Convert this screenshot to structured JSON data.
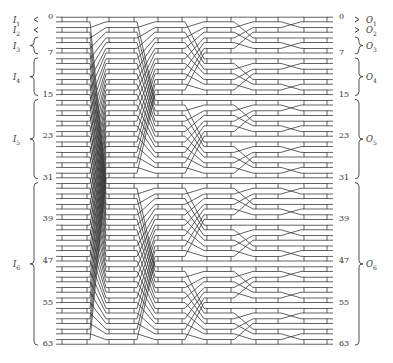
{
  "diagram": {
    "type": "multistage shuffle switching network",
    "lines": 64,
    "rows_per_column": 32,
    "stages": 6,
    "colors": {
      "stroke": "#3a3a3a",
      "box_fill": "#ffffff",
      "background": "#ffffff"
    },
    "layout": {
      "row0_y": 19.5,
      "row_spacing": 10.4,
      "box_height": 4.6,
      "columns_x": [
        [
          62,
          87
        ],
        [
          109,
          134
        ],
        [
          158,
          182
        ],
        [
          207,
          231
        ],
        [
          256,
          278
        ],
        [
          304,
          327
        ]
      ],
      "input_stub_x": 56,
      "output_stub_x": 333
    },
    "input_index_labels": [
      {
        "text": "0",
        "row": 0
      },
      {
        "text": "7",
        "row": 3
      },
      {
        "text": "15",
        "row": 7
      },
      {
        "text": "23",
        "row": 11
      },
      {
        "text": "31",
        "row": 15
      },
      {
        "text": "39",
        "row": 19
      },
      {
        "text": "47",
        "row": 23
      },
      {
        "text": "55",
        "row": 27
      },
      {
        "text": "63",
        "row": 31
      }
    ],
    "output_index_labels": [
      {
        "text": "0",
        "row": 0
      },
      {
        "text": "7",
        "row": 3
      },
      {
        "text": "15",
        "row": 7
      },
      {
        "text": "23",
        "row": 11
      },
      {
        "text": "31",
        "row": 15
      },
      {
        "text": "39",
        "row": 19
      },
      {
        "text": "47",
        "row": 23
      },
      {
        "text": "55",
        "row": 27
      },
      {
        "text": "63",
        "row": 31
      }
    ],
    "input_groups": [
      {
        "name": "I",
        "sub": "1",
        "from_row": 0,
        "to_row": 0,
        "marker": "arrow"
      },
      {
        "name": "I",
        "sub": "2",
        "from_row": 1,
        "to_row": 1,
        "marker": "arrow"
      },
      {
        "name": "I",
        "sub": "3",
        "from_row": 2,
        "to_row": 3,
        "marker": "brace"
      },
      {
        "name": "I",
        "sub": "4",
        "from_row": 4,
        "to_row": 7,
        "marker": "brace"
      },
      {
        "name": "I",
        "sub": "5",
        "from_row": 8,
        "to_row": 15,
        "marker": "brace"
      },
      {
        "name": "I",
        "sub": "6",
        "from_row": 16,
        "to_row": 31,
        "marker": "brace"
      }
    ],
    "output_groups": [
      {
        "name": "O",
        "sub": "1",
        "from_row": 0,
        "to_row": 0,
        "marker": "arrow"
      },
      {
        "name": "O",
        "sub": "2",
        "from_row": 1,
        "to_row": 1,
        "marker": "arrow"
      },
      {
        "name": "O",
        "sub": "3",
        "from_row": 2,
        "to_row": 3,
        "marker": "brace"
      },
      {
        "name": "O",
        "sub": "4",
        "from_row": 4,
        "to_row": 7,
        "marker": "brace"
      },
      {
        "name": "O",
        "sub": "5",
        "from_row": 8,
        "to_row": 15,
        "marker": "brace"
      },
      {
        "name": "O",
        "sub": "6",
        "from_row": 16,
        "to_row": 31,
        "marker": "brace"
      }
    ]
  }
}
